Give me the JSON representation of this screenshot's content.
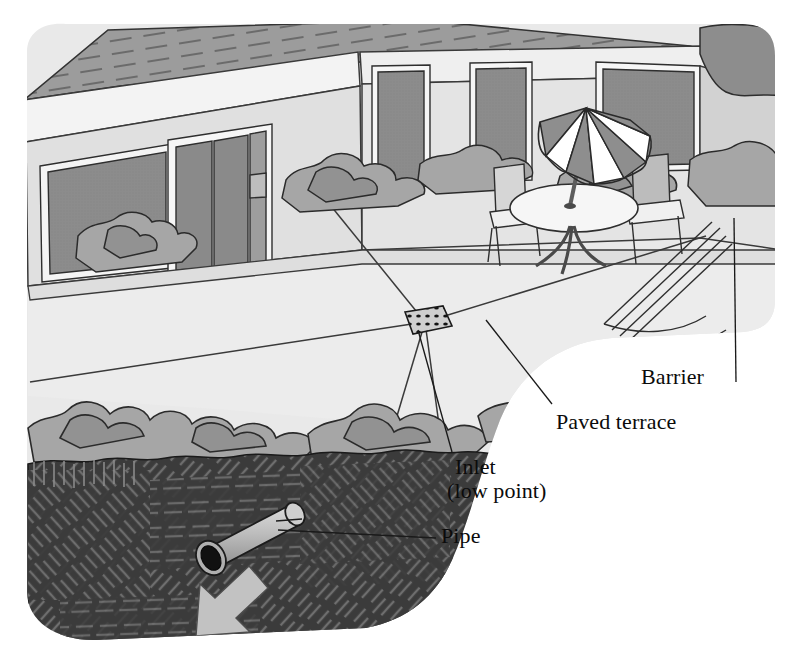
{
  "illustration": {
    "title": "Paved terrace drainage to inlet and pipe",
    "subject": "House terrace sloping to a central drainage inlet connected to an underground pipe",
    "background_color": "#ffffff"
  },
  "labels": [
    {
      "id": "barrier",
      "text": "Barrier",
      "x": 641,
      "y": 365
    },
    {
      "id": "paved_terrace",
      "text": "Paved terrace",
      "x": 556,
      "y": 410
    },
    {
      "id": "inlet",
      "text": "Inlet",
      "x": 455,
      "y": 455
    },
    {
      "id": "inlet_sub",
      "text": "(low point)",
      "x": 447,
      "y": 479
    },
    {
      "id": "pipe",
      "text": "Pipe",
      "x": 441,
      "y": 524
    }
  ],
  "scene": {
    "house": {
      "name": "house-facade",
      "roof_color": "#9a9a9a",
      "wall_color": "#dcdcdc",
      "window_color": "#8c8c8c",
      "trim_color": "#f2f2f2",
      "window_count": 7
    },
    "terrace": {
      "name": "paved-terrace",
      "surface_color": "#ececec",
      "facet_count": 5,
      "slope_note": "surface facets fall toward the inlet"
    },
    "inlet": {
      "name": "drainage-inlet-grate",
      "shape": "perforated diamond grate",
      "fill_color": "#c9c9c9",
      "x": 425,
      "y": 322
    },
    "barrier": {
      "name": "terrace-barrier-edging",
      "style": "thin parallel lines",
      "color": "#4a4a4a"
    },
    "planting": {
      "name": "shrub-hedge",
      "color": "#a6a6a6",
      "shade_color": "#919191",
      "outline_color": "#2f2f2f"
    },
    "furniture": {
      "umbrella": {
        "name": "patio-umbrella",
        "panel_dark": "#8e8e8e",
        "panel_light": "#ffffff",
        "panels": 8
      },
      "table": {
        "name": "patio-table",
        "top_color": "#f4f4f4"
      },
      "chairs": {
        "name": "patio-chair",
        "count": 2,
        "color": "#d8d8d8"
      }
    },
    "ground": {
      "name": "soil-cross-section",
      "soil_color": "#3b3b3b",
      "hatch_color": "#6f6f6f"
    },
    "pipe": {
      "name": "drain-pipe",
      "body_color": "#b7b7b7",
      "opening_color": "#121212",
      "direction": "down-left"
    },
    "flow_arrow": {
      "name": "flow-direction-arrow",
      "color": "#c2c2c2",
      "direction": "down-left"
    }
  }
}
